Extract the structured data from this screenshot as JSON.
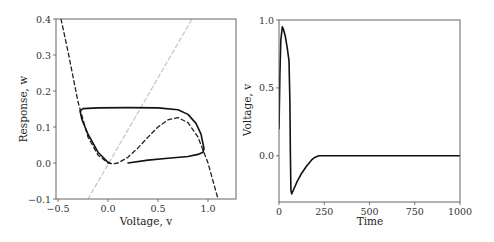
{
  "chart_data": [
    {
      "type": "line",
      "title": "",
      "xlabel": "Voltage, v",
      "ylabel": "Response, w",
      "xlim": [
        -0.52,
        1.28
      ],
      "ylim": [
        -0.1,
        0.4
      ],
      "xticks": [
        -0.5,
        0.0,
        0.5,
        1.0
      ],
      "xtick_labels": [
        "−0.5",
        "0.0",
        "0.5",
        "1.0"
      ],
      "yticks": [
        -0.1,
        0.0,
        0.1,
        0.2,
        0.3,
        0.4
      ],
      "ytick_labels": [
        "−0.1",
        "0.0",
        "0.1",
        "0.2",
        "0.3",
        "0.4"
      ],
      "grid": false,
      "legend": null,
      "series": [
        {
          "name": "v-nullcline (cubic, dashed)",
          "style": "dashed",
          "color": "#222222",
          "x": [
            -0.47,
            -0.4,
            -0.3,
            -0.2,
            -0.1,
            0.0,
            0.05,
            0.1,
            0.2,
            0.3,
            0.4,
            0.5,
            0.6,
            0.7,
            0.8,
            0.9,
            1.0,
            1.05,
            1.1
          ],
          "y": [
            0.4,
            0.31,
            0.17,
            0.072,
            0.022,
            0.0,
            -0.0024,
            0.0,
            0.016,
            0.042,
            0.072,
            0.1,
            0.12,
            0.126,
            0.112,
            0.072,
            0.0,
            -0.05,
            -0.1
          ]
        },
        {
          "name": "w-nullcline (line, light gray dashed)",
          "style": "dashed",
          "color": "#c8c8c8",
          "x": [
            -0.2,
            0.84
          ],
          "y": [
            -0.1,
            0.4
          ]
        },
        {
          "name": "trajectory (solid)",
          "style": "solid",
          "color": "#111111",
          "x": [
            0.2,
            0.4,
            0.6,
            0.8,
            0.9,
            0.95,
            0.96,
            0.93,
            0.88,
            0.8,
            0.7,
            0.5,
            0.2,
            -0.1,
            -0.25,
            -0.28,
            -0.26,
            -0.2,
            -0.1,
            0.0,
            0.02
          ],
          "y": [
            0.0,
            0.008,
            0.013,
            0.018,
            0.024,
            0.03,
            0.04,
            0.08,
            0.11,
            0.135,
            0.148,
            0.153,
            0.154,
            0.153,
            0.151,
            0.145,
            0.12,
            0.08,
            0.03,
            0.002,
            0.0
          ]
        }
      ]
    },
    {
      "type": "line",
      "title": "",
      "xlabel": "Time",
      "ylabel": "Voltage, v",
      "xlim": [
        0,
        1000
      ],
      "ylim": [
        -0.34,
        1.0
      ],
      "xticks": [
        0,
        250,
        500,
        750,
        1000
      ],
      "xtick_labels": [
        "0",
        "250",
        "500",
        "750",
        "1000"
      ],
      "yticks": [
        0.0,
        0.5,
        1.0
      ],
      "ytick_labels": [
        "0.0",
        "0.5",
        "1.0"
      ],
      "grid": false,
      "legend": null,
      "series": [
        {
          "name": "v(t)",
          "style": "solid",
          "color": "#111111",
          "x": [
            0,
            5,
            10,
            18,
            25,
            35,
            45,
            55,
            60,
            63,
            66,
            70,
            80,
            100,
            120,
            150,
            180,
            200,
            220,
            240,
            300,
            500,
            750,
            1000
          ],
          "y": [
            0.2,
            0.6,
            0.85,
            0.95,
            0.93,
            0.88,
            0.8,
            0.7,
            0.4,
            0.0,
            -0.25,
            -0.28,
            -0.25,
            -0.19,
            -0.14,
            -0.08,
            -0.03,
            -0.01,
            0.0,
            0.0,
            0.0,
            0.0,
            0.0,
            0.0
          ]
        }
      ]
    }
  ]
}
